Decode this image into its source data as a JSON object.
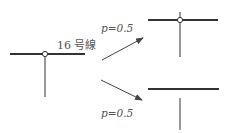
{
  "diagram": {
    "colors": {
      "line": "#333333",
      "thin_line": "#555555",
      "text": "#555555",
      "node_fill": "#ffffff"
    },
    "initial": {
      "line_label": "16 号線",
      "description": "T-junction with node on line 16"
    },
    "transitions": [
      {
        "label": "p=0.5",
        "result": "connected cross junction with node"
      },
      {
        "label": "p=0.5",
        "result": "disconnected: horizontal line separated from vertical segment"
      }
    ]
  }
}
